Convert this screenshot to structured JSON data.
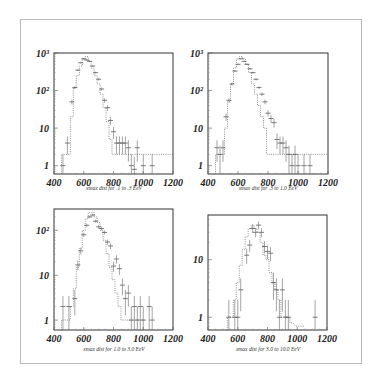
{
  "figure": {
    "panels": [
      {
        "id": "tl",
        "caption": "xmax dist for .1 to .3 EeV",
        "frame": {
          "x": 54,
          "y": 53,
          "w": 119,
          "h": 121
        },
        "caption_pos": {
          "x": 114,
          "y": 189
        }
      },
      {
        "id": "tr",
        "caption": "xmax dist for .3 to 1.0 EeV",
        "frame": {
          "x": 208,
          "y": 53,
          "w": 120,
          "h": 121
        },
        "caption_pos": {
          "x": 268,
          "y": 189
        }
      },
      {
        "id": "bl",
        "caption": "xmax dist for 1.0 to 3.0 EeV",
        "frame": {
          "x": 54,
          "y": 209,
          "w": 119,
          "h": 121
        },
        "caption_pos": {
          "x": 114,
          "y": 350
        }
      },
      {
        "id": "br",
        "caption": "xmax dist for 3.0 to 10.0 EeV",
        "frame": {
          "x": 208,
          "y": 215,
          "w": 119,
          "h": 115
        },
        "caption_pos": {
          "x": 268,
          "y": 350
        }
      }
    ]
  },
  "chart_data": [
    {
      "type": "bar",
      "title": "xmax dist for .1 to .3 EeV",
      "xlabel": "",
      "ylabel": "",
      "xscale": "linear",
      "yscale": "log",
      "xlim": [
        400,
        1200
      ],
      "ylim": [
        0.6,
        1000
      ],
      "x_ticks": [
        400,
        600,
        800,
        1000,
        1200
      ],
      "y_ticks": [
        {
          "value": 1,
          "label": "1"
        },
        {
          "value": 10,
          "label": "10"
        },
        {
          "value": 100,
          "label": "10²"
        },
        {
          "value": 1000,
          "label": "10³"
        }
      ],
      "grid": false,
      "series": [
        {
          "name": "data (points with error bars)",
          "style": "errorbar",
          "x": [
            460,
            490,
            520,
            540,
            560,
            580,
            600,
            620,
            640,
            660,
            680,
            700,
            720,
            740,
            760,
            780,
            800,
            820,
            840,
            860,
            880,
            900,
            920,
            940,
            960,
            1000,
            1060
          ],
          "y": [
            1,
            4,
            50,
            120,
            350,
            550,
            700,
            650,
            600,
            450,
            300,
            200,
            110,
            55,
            35,
            16,
            8,
            4,
            4,
            4,
            4,
            3,
            1,
            0.8,
            3,
            1,
            1
          ]
        },
        {
          "name": "simulation (dotted histogram)",
          "style": "step-dotted",
          "x": [
            460,
            480,
            500,
            520,
            540,
            560,
            580,
            600,
            620,
            640,
            660,
            680,
            700,
            720,
            740,
            760,
            780,
            800,
            820,
            1200
          ],
          "y": [
            2,
            2,
            2,
            20,
            120,
            250,
            450,
            700,
            800,
            600,
            400,
            250,
            150,
            80,
            35,
            15,
            5,
            2,
            2,
            2
          ]
        }
      ]
    },
    {
      "type": "bar",
      "title": "xmax dist for .3 to 1.0 EeV",
      "xlabel": "",
      "ylabel": "",
      "xscale": "linear",
      "yscale": "log",
      "xlim": [
        400,
        1200
      ],
      "ylim": [
        0.6,
        1000
      ],
      "x_ticks": [
        400,
        600,
        800,
        1000,
        1200
      ],
      "y_ticks": [
        {
          "value": 1,
          "label": "1"
        },
        {
          "value": 10,
          "label": "10"
        },
        {
          "value": 100,
          "label": "10²"
        },
        {
          "value": 1000,
          "label": "10³"
        }
      ],
      "grid": false,
      "series": [
        {
          "name": "data (points with error bars)",
          "style": "errorbar",
          "x": [
            460,
            480,
            500,
            520,
            540,
            560,
            580,
            600,
            620,
            640,
            660,
            680,
            700,
            720,
            740,
            760,
            780,
            800,
            820,
            840,
            860,
            880,
            900,
            920,
            940,
            960,
            980,
            1000,
            1040,
            1080
          ],
          "y": [
            3,
            2,
            3,
            20,
            55,
            150,
            330,
            500,
            700,
            600,
            500,
            380,
            300,
            200,
            120,
            80,
            50,
            25,
            18,
            14,
            5,
            4,
            4,
            3,
            2,
            1,
            2,
            1,
            1,
            1
          ]
        },
        {
          "name": "simulation (dotted histogram)",
          "style": "step-dotted",
          "x": [
            460,
            480,
            500,
            520,
            540,
            560,
            580,
            600,
            620,
            640,
            660,
            680,
            700,
            720,
            740,
            760,
            780,
            800,
            820,
            1200
          ],
          "y": [
            2,
            2,
            2,
            10,
            50,
            150,
            400,
            700,
            800,
            700,
            500,
            300,
            150,
            80,
            40,
            20,
            10,
            2,
            2,
            2
          ]
        }
      ]
    },
    {
      "type": "bar",
      "title": "xmax dist for 1.0 to 3.0 EeV",
      "xlabel": "",
      "ylabel": "",
      "xscale": "linear",
      "yscale": "log",
      "xlim": [
        400,
        1200
      ],
      "ylim": [
        0.6,
        300
      ],
      "x_ticks": [
        400,
        600,
        800,
        1000,
        1200
      ],
      "y_ticks": [
        {
          "value": 1,
          "label": "1"
        },
        {
          "value": 10,
          "label": "10"
        },
        {
          "value": 100,
          "label": "10²"
        }
      ],
      "grid": false,
      "series": [
        {
          "name": "data (points with error bars)",
          "style": "errorbar",
          "x": [
            460,
            500,
            540,
            560,
            580,
            600,
            620,
            640,
            660,
            680,
            700,
            720,
            740,
            760,
            780,
            800,
            820,
            840,
            860,
            880,
            900,
            920,
            940,
            960,
            980,
            1000,
            1040,
            1060
          ],
          "y": [
            2,
            2,
            3,
            17,
            35,
            80,
            130,
            200,
            220,
            160,
            120,
            110,
            90,
            55,
            45,
            16,
            23,
            14,
            6,
            3,
            4,
            1,
            2,
            1,
            2,
            1,
            2,
            1
          ]
        },
        {
          "name": "simulation (dotted histogram)",
          "style": "step-dotted",
          "x": [
            460,
            480,
            500,
            520,
            540,
            560,
            580,
            600,
            620,
            640,
            660,
            680,
            700,
            720,
            740,
            760,
            780,
            800,
            820,
            840,
            860,
            880,
            900,
            1000
          ],
          "y": [
            1,
            1,
            1,
            2,
            5,
            15,
            40,
            100,
            180,
            250,
            250,
            200,
            150,
            100,
            60,
            30,
            15,
            8,
            4,
            2,
            1,
            1,
            1,
            1
          ]
        }
      ]
    },
    {
      "type": "bar",
      "title": "xmax dist for 3.0 to 10.0 EeV",
      "xlabel": "",
      "ylabel": "",
      "xscale": "linear",
      "yscale": "log",
      "xlim": [
        400,
        1200
      ],
      "ylim": [
        0.6,
        60
      ],
      "x_ticks": [
        400,
        600,
        800,
        1000,
        1200
      ],
      "y_ticks": [
        {
          "value": 1,
          "label": "1"
        },
        {
          "value": 10,
          "label": "10"
        }
      ],
      "grid": false,
      "series": [
        {
          "name": "data (points with error bars)",
          "style": "errorbar",
          "x": [
            540,
            580,
            600,
            620,
            660,
            680,
            700,
            720,
            740,
            760,
            780,
            800,
            820,
            840,
            860,
            880,
            900,
            920,
            940,
            1120
          ],
          "y": [
            1,
            1,
            1,
            3,
            12,
            18,
            35,
            30,
            40,
            30,
            17,
            14,
            13,
            4,
            3,
            1,
            3,
            1,
            1,
            1
          ]
        },
        {
          "name": "simulation (dotted histogram)",
          "style": "step-dotted",
          "x": [
            540,
            560,
            580,
            600,
            620,
            640,
            660,
            680,
            700,
            720,
            740,
            760,
            780,
            800,
            820,
            840,
            860,
            880,
            900,
            920,
            940,
            960,
            1000,
            1020,
            1040
          ],
          "y": [
            1,
            1,
            2,
            4,
            8,
            15,
            25,
            35,
            40,
            35,
            30,
            20,
            12,
            10,
            6,
            4,
            3,
            2,
            1,
            1,
            1,
            0.8,
            0.7,
            0.7,
            0.7
          ]
        }
      ]
    }
  ]
}
